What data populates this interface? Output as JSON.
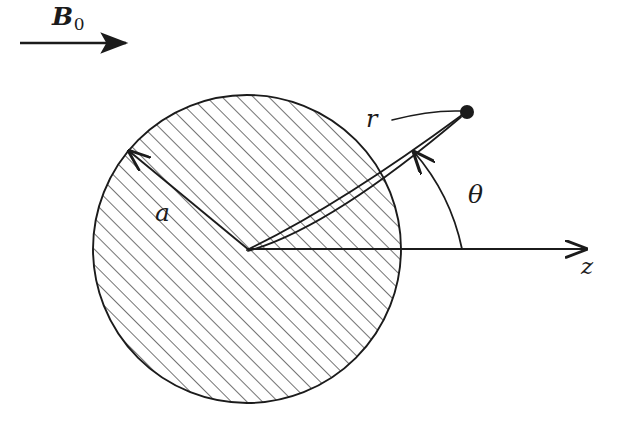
{
  "figure": {
    "background_color": "#ffffff",
    "ink_color": "#1b1b1b",
    "hatch_color": "#555555",
    "width": 621,
    "height": 444
  },
  "labels": {
    "field": {
      "symbol": "B",
      "subscript": "0",
      "name": "applied-field"
    },
    "radius": {
      "symbol": "a",
      "name": "sphere-radius"
    },
    "position": {
      "symbol": "r",
      "name": "radial-coordinate"
    },
    "angle": {
      "symbol": "θ",
      "name": "polar-angle"
    },
    "axis": {
      "symbol": "z",
      "name": "z-axis"
    }
  },
  "geometry": {
    "circle": {
      "cx": 247,
      "cy": 249,
      "r": 154
    },
    "center_point": {
      "x": 247,
      "y": 249
    },
    "field_arrow": {
      "x1": 20,
      "y1": 43,
      "x2": 131,
      "y2": 43
    },
    "z_axis": {
      "x1": 247,
      "y1": 249,
      "x2": 592,
      "y2": 249
    },
    "radius_arrow": {
      "x1": 247,
      "y1": 249,
      "x2": 126,
      "y2": 148
    },
    "r_vector": {
      "x1": 247,
      "y1": 249,
      "x2": 466,
      "y2": 113
    },
    "field_point": {
      "x": 467,
      "y": 112,
      "radius": 7
    },
    "theta_arc": {
      "start_x": 462,
      "start_y": 249,
      "end_x": 411,
      "end_y": 147
    },
    "hatch_angle_deg": 45,
    "hatch_spacing": 11
  }
}
